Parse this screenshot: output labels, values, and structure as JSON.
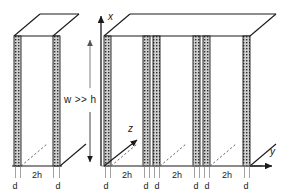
{
  "figure": {
    "background_color": "#ffffff",
    "line_color": "#1a1a1a",
    "wall_fill_color": "#c8c8c8",
    "wall_hatch_color": "#333333",
    "dashed_color": "#555555",
    "axis_color": "#1a1a1a"
  },
  "axes": {
    "x_label": "x",
    "y_label": "y",
    "z_label": "z",
    "origin_note": ""
  },
  "annotations": {
    "aspect_ratio": "w >> h"
  },
  "dimension_labels": {
    "wall_thickness": "d",
    "channel_width": "2h"
  },
  "bottom_labels": [
    {
      "text": "d",
      "x": 18,
      "type": "wall"
    },
    {
      "text": "2h",
      "x": 37,
      "type": "channel"
    },
    {
      "text": "2h",
      "x": 37,
      "type": "channel-hidden"
    },
    {
      "text": "d",
      "x": 57,
      "type": "wall"
    },
    {
      "text": "d",
      "x": 108,
      "type": "wall"
    },
    {
      "text": "2h",
      "x": 127,
      "type": "channel"
    },
    {
      "text": "d",
      "x": 147,
      "type": "wall"
    },
    {
      "text": "d",
      "x": 157,
      "type": "wall"
    },
    {
      "text": "2h",
      "x": 177,
      "type": "channel"
    },
    {
      "text": "d",
      "x": 197,
      "type": "wall"
    },
    {
      "text": "d",
      "x": 207,
      "type": "wall"
    },
    {
      "text": "2h",
      "x": 227,
      "type": "channel"
    },
    {
      "text": "d",
      "x": 247,
      "type": "wall"
    }
  ],
  "walls": [
    {
      "id": "w-left-1",
      "x": 14,
      "width": 7,
      "group": "left-block",
      "paired": false
    },
    {
      "id": "w-left-2",
      "x": 53,
      "width": 7,
      "group": "left-block",
      "paired": false
    },
    {
      "id": "w-main-1",
      "x": 104,
      "width": 7,
      "group": "main-block",
      "paired": false
    },
    {
      "id": "w-main-2",
      "x": 143,
      "width": 7,
      "group": "main-block",
      "paired": true
    },
    {
      "id": "w-main-3",
      "x": 153,
      "width": 7,
      "group": "main-block",
      "paired": true
    },
    {
      "id": "w-main-4",
      "x": 193,
      "width": 7,
      "group": "main-block",
      "paired": true
    },
    {
      "id": "w-main-5",
      "x": 203,
      "width": 7,
      "group": "main-block",
      "paired": true
    },
    {
      "id": "w-main-6",
      "x": 243,
      "width": 7,
      "group": "main-block",
      "paired": false
    }
  ],
  "geometry": {
    "top_y": 36,
    "bottom_y": 166,
    "depth_dx": 26,
    "depth_dy": -22
  }
}
